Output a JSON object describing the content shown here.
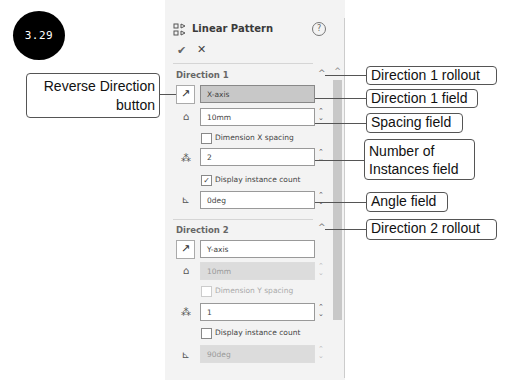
{
  "figure_badge": "3.29",
  "panel": {
    "title": "Linear Pattern",
    "title_icon": "linear-pattern-icon",
    "help_icon": "?",
    "ok_icon": "✔",
    "cancel_icon": "✕",
    "direction1": {
      "title": "Direction 1",
      "collapse_icon": "^",
      "reverse_icon": "↗",
      "direction_field": "X-axis",
      "spacing_value": "10mm",
      "dimension_spacing_label": "Dimension X spacing",
      "dimension_spacing_checked": false,
      "instances_value": "2",
      "display_count_label": "Display instance count",
      "display_count_checked": true,
      "angle_value": "0deg"
    },
    "direction2": {
      "title": "Direction 2",
      "collapse_icon": "^",
      "reverse_icon": "↗",
      "direction_field": "Y-axis",
      "spacing_value": "10mm",
      "dimension_spacing_label": "Dimension Y spacing",
      "dimension_spacing_checked": false,
      "instances_value": "1",
      "display_count_label": "Display instance count",
      "display_count_checked": false,
      "angle_value": "90deg"
    }
  },
  "callouts": {
    "reverse_direction": [
      "Reverse Direction",
      "button"
    ],
    "direction1_rollout": "Direction 1 rollout",
    "direction1_field": "Direction 1 field",
    "spacing_field": "Spacing field",
    "instances_field": [
      "Number of",
      "Instances field"
    ],
    "angle_field": "Angle field",
    "direction2_rollout": "Direction 2 rollout"
  }
}
